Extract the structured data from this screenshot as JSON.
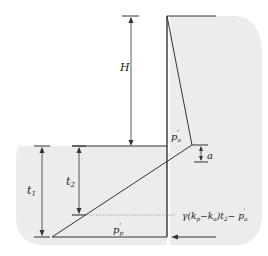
{
  "diagram": {
    "labels": {
      "H": "H",
      "t1": "t",
      "t1_sub": "1",
      "t2": "t",
      "t2_sub": "2",
      "pa": "p",
      "pa_sub": "a",
      "pa_prime": "'",
      "pp": "p",
      "pp_sub": "p",
      "pp_prime": "'",
      "a": "a",
      "formula": "γ(k",
      "formula_sub_p": "p",
      "formula_mid": "−k",
      "formula_sub_a": "a",
      "formula_t": ")t",
      "formula_sub_2": "2",
      "formula_end": "− p",
      "formula_end_sub": "a",
      "formula_end_prime": "'"
    },
    "colors": {
      "soil_fill": "#ececec",
      "line": "#333333",
      "dotted": "#999999"
    }
  }
}
